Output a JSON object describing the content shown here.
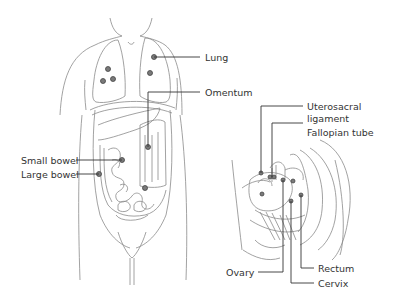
{
  "diagram": {
    "type": "anatomical-illustration",
    "figures": [
      {
        "name": "front torso",
        "view": "anterior"
      },
      {
        "name": "pelvis",
        "view": "sagittal cross-section"
      }
    ],
    "colors": {
      "outline": "#8a8a8a",
      "leader": "#333333",
      "dot": "#7a7a7a",
      "text": "#333333"
    }
  },
  "labels": {
    "lung": "Lung",
    "omentum": "Omentum",
    "small_bowel": "Small bowel",
    "large_bowel": "Large bowel",
    "uterosacral_1": "Uterosacral",
    "uterosacral_2": "ligament",
    "fallopian_tube": "Fallopian tube",
    "ovary": "Ovary",
    "rectum": "Rectum",
    "cervix": "Cervix"
  }
}
